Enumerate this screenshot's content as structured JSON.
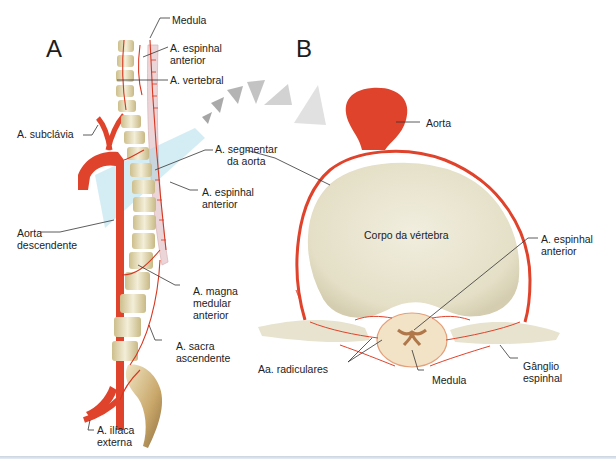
{
  "panels": {
    "a": {
      "letter": "A",
      "labels": {
        "medula": "Medula",
        "espinhal_anterior_top": [
          "A. espinhal",
          "anterior"
        ],
        "vertebral": "A. vertebral",
        "subclavia": "A. subclávia",
        "segmentar": [
          "A. segmentar",
          "da aorta"
        ],
        "espinhal_anterior_mid": [
          "A. espinhal",
          "anterior"
        ],
        "aorta_descendente": [
          "Aorta",
          "descendente"
        ],
        "magna": [
          "A. magna",
          "medular",
          "anterior"
        ],
        "sacra": [
          "A. sacra",
          "ascendente"
        ],
        "iliaca": [
          "A. ilíaca",
          "externa"
        ]
      }
    },
    "b": {
      "letter": "B",
      "labels": {
        "aorta": "Aorta",
        "corpo": "Corpo da vértebra",
        "espinhal_anterior": [
          "A. espinhal",
          "anterior"
        ],
        "radiculares": "Aa. radiculares",
        "medula": "Medula",
        "ganglio": [
          "Gânglio",
          "espinhal"
        ]
      }
    }
  },
  "colors": {
    "artery": "#e0432b",
    "bone": "#ece6cf",
    "bone_shadow": "#c9bd8e",
    "cord": "#efd9d9",
    "plane": "#9fd6e6",
    "chevron": "#b9b9b9",
    "leader": "#333333"
  }
}
